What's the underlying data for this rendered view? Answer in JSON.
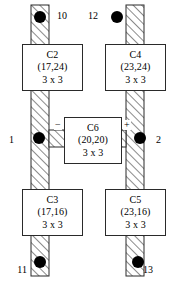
{
  "figure": {
    "type": "schematic-layout-diagram",
    "width": 174,
    "height": 281,
    "background_color": "#ffffff",
    "line_color": "#2a2a2a",
    "hatch_color": "#2a2a2a",
    "terminal_color": "#000000"
  },
  "cells": [
    {
      "id": "C2",
      "name": "C2",
      "coords": "(17,24)",
      "size": "3 x 3",
      "x": 22,
      "y": 44,
      "w": 61,
      "h": 47
    },
    {
      "id": "C4",
      "name": "C4",
      "coords": "(23,24)",
      "size": "3 x 3",
      "x": 105,
      "y": 44,
      "w": 61,
      "h": 47
    },
    {
      "id": "C6",
      "name": "C6",
      "coords": "(20,20)",
      "size": "3 x 3",
      "x": 64,
      "y": 117,
      "w": 58,
      "h": 47
    },
    {
      "id": "C3",
      "name": "C3",
      "coords": "(17,16)",
      "size": "3 x 3",
      "x": 22,
      "y": 189,
      "w": 61,
      "h": 47
    },
    {
      "id": "C5",
      "name": "C5",
      "coords": "(23,16)",
      "size": "3 x 3",
      "x": 105,
      "y": 189,
      "w": 61,
      "h": 47
    }
  ],
  "pins": [
    {
      "label": "10",
      "x": 57,
      "y": 11,
      "align": "left"
    },
    {
      "label": "12",
      "x": 98,
      "y": 11,
      "align": "right"
    },
    {
      "label": "1",
      "x": 14,
      "y": 135,
      "align": "right"
    },
    {
      "label": "2",
      "x": 156,
      "y": 135,
      "align": "left"
    },
    {
      "label": "11",
      "x": 27,
      "y": 265,
      "align": "right"
    },
    {
      "label": "13",
      "x": 143,
      "y": 265,
      "align": "left"
    }
  ],
  "terminals": [
    {
      "name": "terminal-10",
      "cx": 40,
      "cy": 17,
      "r": 6
    },
    {
      "name": "terminal-12",
      "cx": 117,
      "cy": 17,
      "r": 6
    },
    {
      "name": "terminal-1",
      "cx": 39,
      "cy": 138,
      "r": 6
    },
    {
      "name": "terminal-2",
      "cx": 140,
      "cy": 138,
      "r": 6
    },
    {
      "name": "terminal-11",
      "cx": 40,
      "cy": 262,
      "r": 6
    },
    {
      "name": "terminal-13",
      "cx": 138,
      "cy": 262,
      "r": 6
    }
  ],
  "signs": [
    {
      "label": "−",
      "name": "minus-sign",
      "x": 54,
      "y": 120
    },
    {
      "label": "+",
      "name": "plus-sign",
      "x": 123,
      "y": 120
    }
  ],
  "nets": [
    {
      "name": "left-rail",
      "x": 31,
      "y": 5,
      "w": 18,
      "h": 271
    },
    {
      "name": "right-rail",
      "x": 126,
      "y": 5,
      "w": 18,
      "h": 271
    },
    {
      "name": "left-stub",
      "x": 49,
      "y": 130,
      "w": 16,
      "h": 17
    },
    {
      "name": "right-stub",
      "x": 110,
      "y": 130,
      "w": 16,
      "h": 17
    }
  ]
}
